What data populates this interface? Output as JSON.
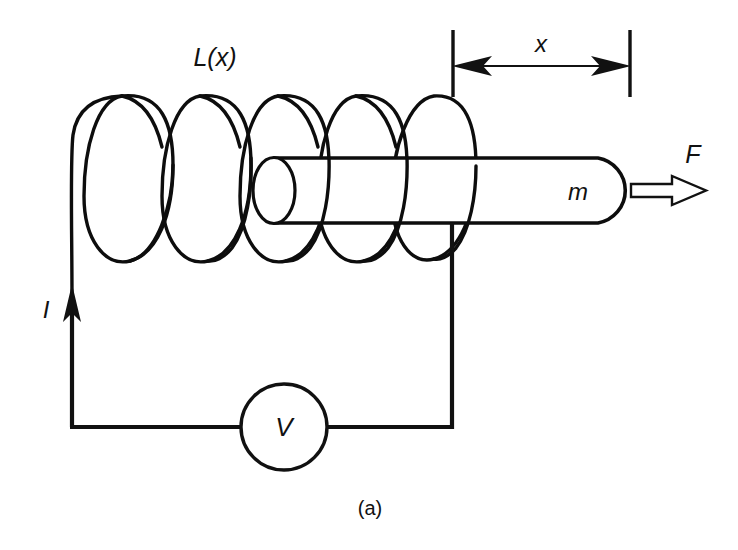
{
  "figure": {
    "caption": "(a)",
    "type": "solenoid-actuator-schematic",
    "background_color": "#ffffff",
    "ink_color": "#111111"
  },
  "labels": {
    "inductance": "L(x)",
    "displacement": "x",
    "mass": "m",
    "force": "F",
    "current": "I",
    "voltage": "V"
  },
  "components": {
    "coil": {
      "name": "inductor-coil",
      "turns": 5,
      "label": "L(x)"
    },
    "plunger": {
      "name": "movable-plunger-rod",
      "label": "m"
    },
    "source": {
      "name": "voltage-source",
      "label": "V"
    },
    "force_arrow": {
      "name": "force-arrow",
      "label": "F",
      "direction": "right",
      "style": "hollow"
    },
    "current_arrow": {
      "name": "current-arrow",
      "label": "I",
      "direction": "up",
      "style": "solid"
    },
    "dimension": {
      "name": "displacement-dimension",
      "label": "x",
      "style": "double-headed"
    }
  }
}
